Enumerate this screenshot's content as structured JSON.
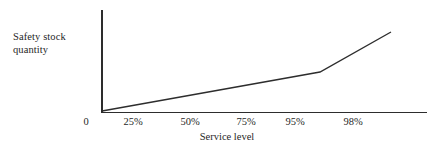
{
  "figure": {
    "background_color": "#ffffff",
    "ink_color": "#2d2d2d",
    "text_color": "#1f1f1f"
  },
  "axes": {
    "y_title": "Safety stock\nquantity",
    "x_title": "Service level"
  },
  "chart_data": {
    "type": "line",
    "title": "",
    "subtitle": "",
    "xlabel": "Service level",
    "ylabel": "Safety stock quantity",
    "grid": false,
    "legend": null,
    "legend_position": "none",
    "annotations": [],
    "x_tick_labels": [
      "0",
      "25%",
      "50%",
      "75%",
      "95%",
      "98%"
    ],
    "x_tick_positions_px": [
      86,
      133,
      190,
      246,
      295,
      353
    ],
    "x_axis_note": "non-linear (compressed) service-level scale; spacing narrows above 75%",
    "y_tick_labels": [],
    "ylim": [
      0,
      1
    ],
    "xlim": [
      0,
      1
    ],
    "series": [
      {
        "name": "Safety stock vs service level",
        "color": "#2d2d2d",
        "line_width_px": 1.4,
        "points_px": [
          {
            "x": 102,
            "y": 111
          },
          {
            "x": 320,
            "y": 72
          },
          {
            "x": 391,
            "y": 32
          }
        ],
        "x": [
          "0%",
          "~96%",
          "~99.5%"
        ],
        "values": [
          0,
          0.39,
          0.79
        ],
        "shape": "piecewise-linear, shallow slope to ~95% then steeper rise"
      }
    ]
  }
}
